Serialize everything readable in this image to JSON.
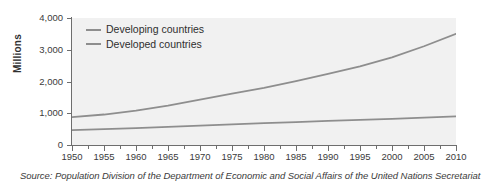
{
  "chart_data": {
    "type": "line",
    "title": "",
    "xlabel": "",
    "ylabel": "Millions",
    "xlim": [
      1950,
      2010
    ],
    "ylim": [
      0,
      4000
    ],
    "grid": false,
    "legend_position": "top-left inside plot",
    "x_ticks": [
      "1950",
      "1955",
      "1960",
      "1965",
      "1970",
      "1975",
      "1980",
      "1985",
      "1990",
      "1995",
      "2000",
      "2005",
      "2010"
    ],
    "x_tick_values": [
      1950,
      1955,
      1960,
      1965,
      1970,
      1975,
      1980,
      1985,
      1990,
      1995,
      2000,
      2005,
      2010
    ],
    "y_ticks": [
      "0",
      "1,000",
      "2,000",
      "3,000",
      "4,000"
    ],
    "y_tick_values": [
      0,
      1000,
      2000,
      3000,
      4000
    ],
    "x": [
      1950,
      1955,
      1960,
      1965,
      1970,
      1975,
      1980,
      1985,
      1990,
      1995,
      2000,
      2005,
      2010
    ],
    "series": [
      {
        "name": "Developing countries",
        "color": "#8e8e8e",
        "values": [
          880,
          960,
          1080,
          1240,
          1430,
          1620,
          1800,
          2010,
          2240,
          2480,
          2760,
          3110,
          3500
        ]
      },
      {
        "name": "Developed countries",
        "color": "#8e8e8e",
        "values": [
          470,
          500,
          530,
          570,
          610,
          650,
          690,
          720,
          760,
          790,
          820,
          860,
          900
        ]
      }
    ],
    "source_note": "Source: Population Division of the Department of Economic and Social Affairs of the United Nations Secretariat",
    "plot_background": "#f1f1f1",
    "figure_background": "#ffffff",
    "axis_color": "#6e6e6e"
  },
  "legend": {
    "items": [
      {
        "label": "Developing countries"
      },
      {
        "label": "Developed countries"
      }
    ]
  },
  "axes": {
    "y_title": "Millions"
  }
}
